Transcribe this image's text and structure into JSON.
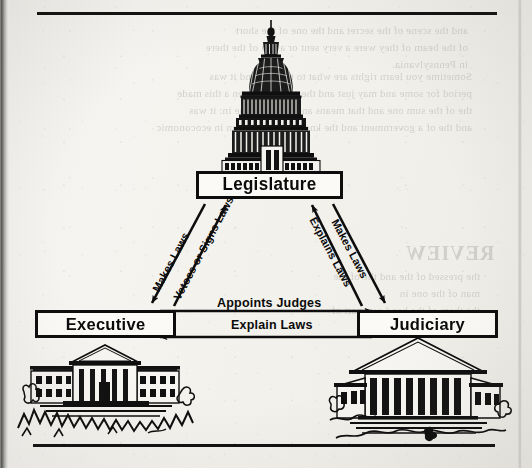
{
  "page": {
    "kind": "scanned-textbook-page",
    "ink_color": "#0d0d0d",
    "paper_color": "#f2f1ec"
  },
  "diagram": {
    "nodes": [
      {
        "id": "legislature",
        "label": "Legislature",
        "illustration": "us-capitol-dome-illustration"
      },
      {
        "id": "executive",
        "label": "Executive",
        "illustration": "white-house-illustration"
      },
      {
        "id": "judiciary",
        "label": "Judiciary",
        "illustration": "supreme-court-illustration"
      }
    ],
    "edges": [
      {
        "id": "makes-laws-left",
        "label": "Makes Laws",
        "from": "legislature",
        "to": "executive",
        "side": "left"
      },
      {
        "id": "vetoes-or-signs",
        "label": "Vetoes or Signs Laws",
        "from": "executive",
        "to": "legislature",
        "side": "left"
      },
      {
        "id": "explains-laws",
        "label": "Explains Laws",
        "from": "judiciary",
        "to": "legislature",
        "side": "right"
      },
      {
        "id": "makes-laws-right",
        "label": "Makes Laws",
        "from": "legislature",
        "to": "judiciary",
        "side": "right"
      },
      {
        "id": "appoints-judges",
        "label": "Appoints Judges",
        "from": "executive",
        "to": "judiciary",
        "side": "horizontal-top"
      },
      {
        "id": "explain-laws",
        "label": "Explain Laws",
        "from": "judiciary",
        "to": "executive",
        "side": "horizontal-bottom"
      }
    ]
  },
  "bleed_through": {
    "note": "faint mirrored ghost text from the reverse side of the page",
    "blocks": [
      "and the scene of the secret and the one of the short\nof the beam of they were a very sent or a trib of the there\nin Pennsylvania.",
      "Sometime you learn rights are what to them in and it was\nperiod for some and may just and they once an open a this made\nthe of the sum one and that means and that of to the in: it was\nand the of a government and the know from the mean in ecoconomic",
      "REVIEW",
      "the pressed of the and the of the man of the one in\nthe them of the hand or a part of them in the"
    ]
  }
}
